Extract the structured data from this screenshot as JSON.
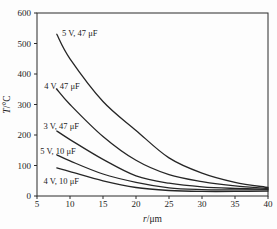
{
  "figure": {
    "background": "#fdfdfd",
    "line_color": "#262626",
    "axis_color": "#2b2b2b",
    "text_color": "#1c1c1c"
  },
  "chart_data": {
    "type": "line",
    "title": "",
    "xlabel": "r/μm",
    "ylabel": "T/°C",
    "xlim": [
      5,
      40
    ],
    "ylim": [
      0,
      600
    ],
    "xticks": [
      5,
      10,
      15,
      20,
      25,
      30,
      35,
      40
    ],
    "yticks": [
      0,
      100,
      200,
      300,
      400,
      500,
      600
    ],
    "grid": false,
    "legend": "inline-labels",
    "x": [
      8,
      10,
      15,
      20,
      25,
      30,
      35,
      40
    ],
    "series": [
      {
        "name": "5V-47uF",
        "label": "5 V, 47 μF",
        "values": [
          530,
          450,
          310,
          215,
          125,
          75,
          45,
          28
        ],
        "label_pos": [
          8.8,
          535
        ]
      },
      {
        "name": "4V-47uF",
        "label": "4 V, 47 μF",
        "values": [
          350,
          300,
          195,
          117,
          70,
          47,
          33,
          25
        ],
        "label_pos": [
          6.1,
          362
        ]
      },
      {
        "name": "3V-47uF",
        "label": "3 V, 47 μF",
        "values": [
          213,
          185,
          120,
          66,
          42,
          30,
          25,
          22
        ],
        "label_pos": [
          6.0,
          228
        ]
      },
      {
        "name": "5V-10uF",
        "label": "5 V, 10 μF",
        "values": [
          135,
          115,
          72,
          45,
          27,
          21,
          20,
          20
        ],
        "label_pos": [
          5.5,
          146
        ]
      },
      {
        "name": "4V-10uF",
        "label": "4 V, 10 μF",
        "values": [
          92,
          80,
          50,
          28,
          18,
          15,
          15,
          16
        ],
        "label_pos": [
          6.0,
          48
        ]
      }
    ]
  }
}
